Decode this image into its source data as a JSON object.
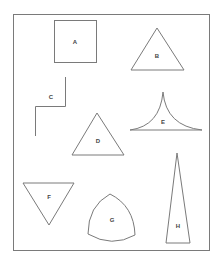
{
  "diagram": {
    "colors": {
      "stroke": "#7a7a7a",
      "label": "#444444",
      "background": "#ffffff"
    },
    "frame": {
      "x": 13,
      "y": 14,
      "width": 197,
      "height": 237
    },
    "shapes": [
      {
        "id": "A",
        "type": "square",
        "label": "A",
        "label_pos": [
          75,
          42
        ]
      },
      {
        "id": "B",
        "type": "equilateral-triangle",
        "label": "B",
        "label_pos": [
          157,
          55
        ]
      },
      {
        "id": "C",
        "type": "step-polyline",
        "label": "C",
        "label_pos": [
          51,
          97
        ]
      },
      {
        "id": "D",
        "type": "equilateral-triangle",
        "label": "D",
        "label_pos": [
          98,
          141
        ]
      },
      {
        "id": "E",
        "type": "concave-triangle",
        "label": "E",
        "label_pos": [
          163,
          122
        ]
      },
      {
        "id": "F",
        "type": "inverted-triangle",
        "label": "F",
        "label_pos": [
          49,
          197
        ]
      },
      {
        "id": "G",
        "type": "reuleaux-triangle",
        "label": "G",
        "label_pos": [
          112,
          220
        ]
      },
      {
        "id": "H",
        "type": "isosceles-triangle",
        "label": "H",
        "label_pos": [
          178,
          226
        ]
      }
    ]
  }
}
